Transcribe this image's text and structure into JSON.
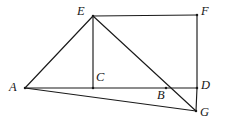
{
  "figure": {
    "canvas": {
      "width": 225,
      "height": 139
    },
    "stroke_color": "#1a1a1a",
    "background_color": "#ffffff",
    "label_color": "#171717",
    "points": [
      {
        "id": "A",
        "label": "A",
        "x": 25,
        "y": 88,
        "label_x": 9,
        "label_y": 81
      },
      {
        "id": "B",
        "label": "B",
        "x": 166,
        "y": 88,
        "label_x": 157,
        "label_y": 89
      },
      {
        "id": "C",
        "label": "C",
        "x": 93,
        "y": 88,
        "label_x": 96,
        "label_y": 71
      },
      {
        "id": "D",
        "label": "D",
        "x": 197,
        "y": 88,
        "label_x": 201,
        "label_y": 79
      },
      {
        "id": "E",
        "label": "E",
        "x": 93,
        "y": 16,
        "label_x": 77,
        "label_y": 5
      },
      {
        "id": "F",
        "label": "F",
        "x": 197,
        "y": 15,
        "label_x": 201,
        "label_y": 5
      },
      {
        "id": "G",
        "label": "G",
        "x": 196,
        "y": 111,
        "label_x": 200,
        "label_y": 106
      }
    ],
    "segments": [
      {
        "id": "EF",
        "name": "segment-ef",
        "from": "E",
        "to": "F"
      },
      {
        "id": "FD",
        "name": "segment-fd",
        "from": "F",
        "to": "D"
      },
      {
        "id": "AD",
        "name": "segment-ad",
        "from": "A",
        "to": "D"
      },
      {
        "id": "AE",
        "name": "segment-ae",
        "from": "A",
        "to": "E"
      },
      {
        "id": "EC",
        "name": "segment-ec",
        "from": "E",
        "to": "C"
      },
      {
        "id": "EG",
        "name": "segment-eg",
        "from": "E",
        "to": "G"
      },
      {
        "id": "DG",
        "name": "segment-dg",
        "from": "D",
        "to": "G"
      },
      {
        "id": "AG",
        "name": "segment-ag",
        "from": "A",
        "to": "G"
      }
    ]
  }
}
